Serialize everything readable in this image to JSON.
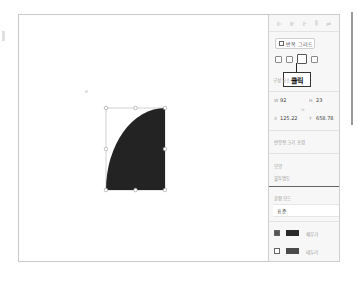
{
  "toolbar": {
    "align_icons": [
      "align-left-icon",
      "align-center-icon",
      "align-right-icon",
      "distribute-icon",
      "more-icon"
    ]
  },
  "panel": {
    "repeat_grid_label": "반복 그리드",
    "boolean_ops": [
      "union-icon",
      "subtract-icon",
      "intersect-icon",
      "exclude-icon"
    ],
    "callout_label": "클릭",
    "component_label": "구성 요소",
    "transform": {
      "w_label": "W",
      "w_value": "92",
      "h_label": "H",
      "h_value": "23",
      "x_label": "X",
      "x_value": "125.22",
      "y_label": "Y",
      "y_value": "658.78"
    },
    "responsive_label": "반응형 크기 조정",
    "appearance_label": "모양",
    "opacity_label": "불투명도",
    "blend_mode_label": "혼합 모드",
    "blend_mode_value": "표준",
    "fill": {
      "checked": true,
      "color": "#2a2a2a",
      "label": "채우기"
    },
    "border": {
      "checked": false,
      "color": "#4a4a4a",
      "label": "테두리"
    }
  },
  "canvas": {
    "shape_fill": "#232323",
    "shape_type": "quarter-circle"
  }
}
